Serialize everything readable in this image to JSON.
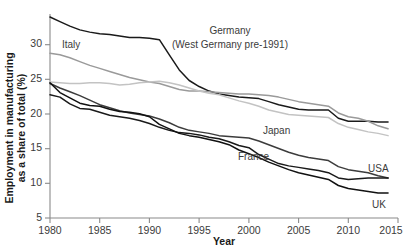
{
  "chart_data": {
    "type": "line",
    "title": "",
    "xlabel": "Year",
    "ylabel": "Employment in manufacturing as a share of total (%)",
    "xlim": [
      1980,
      2015
    ],
    "ylim": [
      5,
      32
    ],
    "grid": false,
    "legend_position": "inline-labels",
    "xticks": [
      1980,
      1985,
      1990,
      1995,
      2000,
      2005,
      2010,
      2015
    ],
    "yticks": [
      5,
      10,
      15,
      20,
      25,
      30
    ],
    "x": [
      1980,
      1981,
      1982,
      1983,
      1984,
      1985,
      1986,
      1987,
      1988,
      1989,
      1990,
      1991,
      1992,
      1993,
      1994,
      1995,
      1996,
      1997,
      1998,
      1999,
      2000,
      2001,
      2002,
      2003,
      2004,
      2005,
      2006,
      2007,
      2008,
      2009,
      2010,
      2011,
      2012,
      2013,
      2014
    ],
    "series": [
      {
        "name": "Germany",
        "label": "Germany",
        "label_sub": "(West Germany pre-1991)",
        "color": "#1a1a1a",
        "values": [
          31.6,
          31.0,
          30.4,
          29.9,
          29.6,
          29.4,
          29.3,
          29.1,
          28.9,
          28.9,
          28.8,
          28.6,
          26.6,
          24.6,
          23.2,
          22.4,
          21.8,
          21.4,
          21.2,
          21.0,
          20.9,
          20.8,
          20.4,
          20.0,
          19.7,
          19.4,
          19.3,
          19.3,
          19.3,
          18.2,
          17.8,
          17.8,
          17.8,
          17.7,
          17.7
        ]
      },
      {
        "name": "Italy",
        "label": "Italy",
        "color": "#9a9a9a",
        "values": [
          26.8,
          26.6,
          26.2,
          25.7,
          25.2,
          24.8,
          24.4,
          24.0,
          23.6,
          23.3,
          23.0,
          22.8,
          22.4,
          22.0,
          21.8,
          21.8,
          21.7,
          21.6,
          21.5,
          21.4,
          21.4,
          21.3,
          21.2,
          21.0,
          20.7,
          20.4,
          20.2,
          20.0,
          19.8,
          18.9,
          18.4,
          18.2,
          17.8,
          17.2,
          16.8
        ]
      },
      {
        "name": "Japan",
        "label": "Japan",
        "color": "#c3c3c3",
        "values": [
          23.0,
          22.9,
          22.8,
          22.8,
          22.9,
          22.9,
          22.8,
          22.6,
          22.7,
          22.9,
          23.0,
          23.1,
          22.9,
          22.6,
          22.2,
          21.8,
          21.5,
          21.3,
          20.9,
          20.5,
          20.2,
          19.8,
          19.3,
          19.0,
          18.7,
          18.6,
          18.5,
          18.4,
          18.3,
          17.5,
          17.0,
          16.7,
          16.4,
          16.2,
          15.9
        ]
      },
      {
        "name": "France",
        "label": "France",
        "color": "#3c3c3c",
        "values": [
          22.8,
          22.2,
          21.7,
          21.2,
          20.6,
          20.0,
          19.6,
          19.2,
          18.9,
          18.7,
          18.5,
          18.1,
          17.6,
          17.0,
          16.6,
          16.4,
          16.2,
          15.9,
          15.8,
          15.7,
          15.6,
          15.2,
          14.7,
          14.2,
          13.7,
          13.3,
          13.0,
          12.8,
          12.6,
          11.8,
          11.4,
          11.2,
          11.0,
          10.6,
          10.3
        ]
      },
      {
        "name": "USA",
        "label": "USA",
        "color": "#1a1a1a",
        "values": [
          21.3,
          21.0,
          20.1,
          19.5,
          19.4,
          19.0,
          18.6,
          18.4,
          18.2,
          17.9,
          17.5,
          17.0,
          16.6,
          16.3,
          16.2,
          16.0,
          15.7,
          15.5,
          15.1,
          14.6,
          14.3,
          13.4,
          12.8,
          12.2,
          11.9,
          11.7,
          11.5,
          11.3,
          11.0,
          10.3,
          10.1,
          10.2,
          10.3,
          10.3,
          10.3
        ]
      },
      {
        "name": "UK",
        "label": "UK",
        "color": "#111111",
        "values": [
          22.9,
          21.6,
          20.9,
          20.2,
          19.9,
          19.8,
          19.4,
          19.1,
          19.0,
          18.8,
          18.4,
          17.4,
          16.8,
          16.2,
          15.9,
          15.7,
          15.4,
          15.1,
          14.7,
          14.0,
          13.5,
          13.0,
          12.4,
          11.9,
          11.4,
          11.0,
          10.7,
          10.4,
          10.1,
          9.3,
          8.9,
          8.7,
          8.5,
          8.3,
          8.3
        ]
      }
    ]
  },
  "labels": {
    "germany_main": "Germany",
    "germany_sub": "(West Germany pre-1991)",
    "italy": "Italy",
    "japan": "Japan",
    "france": "France",
    "usa": "USA",
    "uk": "UK",
    "xaxis_title": "Year",
    "yaxis_title_line1": "Employment in manufacturing",
    "yaxis_title_line2": "as a share of total (%)"
  },
  "ticks": {
    "x": [
      "1980",
      "1985",
      "1990",
      "1995",
      "2000",
      "2005",
      "2010",
      "2015"
    ],
    "y": [
      "5",
      "10",
      "15",
      "20",
      "25",
      "30"
    ]
  }
}
